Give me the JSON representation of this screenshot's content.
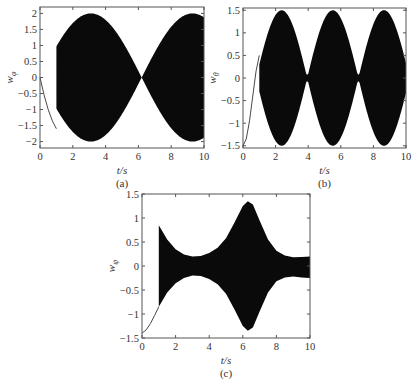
{
  "chart_data": [
    {
      "panel": "(a)",
      "type": "line",
      "title": "",
      "xlabel": "t/s",
      "ylabel": "w_φ",
      "ylabel_main": "w",
      "ylabel_sub": "φ",
      "caption": "(a)",
      "xlim": [
        0,
        10
      ],
      "ylim": [
        -2.2,
        2.2
      ],
      "xticks": [
        0,
        2,
        4,
        6,
        8,
        10
      ],
      "xtick_labels": [
        "0",
        "2",
        "4",
        "6",
        "8",
        "10"
      ],
      "yticks": [
        2,
        1.5,
        1,
        0.5,
        0,
        -0.5,
        -1,
        -1.5,
        -2
      ],
      "ytick_labels": [
        "2",
        "1.5",
        "1",
        "0.5",
        "0",
        "−0.5",
        "−1",
        "−1.5",
        "−2"
      ],
      "grid": false,
      "description": "Initial smooth curve from 0 to about -1.6 over t in [0,1]; then high-frequency oscillation with beating envelope of amplitude |2 sin(pi t / 3.1)|, lobes peaking near t=1.6, 4.7, 7.8 at ±2 and nodes near t=3.1, 6.2, 9.4",
      "initial_curve": {
        "x": [
          0,
          0.25,
          0.5,
          0.75,
          1.0
        ],
        "y": [
          0,
          -0.55,
          -1.0,
          -1.35,
          -1.6
        ]
      },
      "envelope": {
        "start": 1.0,
        "end": 10,
        "amplitude": 2.0,
        "period": 6.2,
        "phase_zero": 0.0
      }
    },
    {
      "panel": "(b)",
      "type": "line",
      "xlabel": "t/s",
      "ylabel": "w_θ",
      "ylabel_main": "w",
      "ylabel_sub": "θ",
      "caption": "(b)",
      "xlim": [
        0,
        10
      ],
      "ylim": [
        -1.55,
        1.55
      ],
      "xticks": [
        0,
        2,
        4,
        6,
        8,
        10
      ],
      "xtick_labels": [
        "0",
        "2",
        "4",
        "6",
        "8",
        "10"
      ],
      "yticks": [
        1.5,
        1,
        0.5,
        0,
        -0.5,
        -1,
        -1.5
      ],
      "ytick_labels": [
        "1.5",
        "1",
        "0.5",
        "0",
        "−0.5",
        "−1",
        "−1.5"
      ],
      "grid": false,
      "description": "Initial curve rising from -1.5 at t=0 to about 0.5 at t=1; then oscillation with envelope lobes peaking at ±1.5 near t=1.6, 3.1, 4.7, 6.3, 7.9, 9.4 and nodes (~±0.1) between",
      "initial_curve": {
        "x": [
          0,
          0.2,
          0.4,
          0.6,
          0.8,
          1.0
        ],
        "y": [
          -1.5,
          -1.35,
          -0.95,
          -0.4,
          0.15,
          0.5
        ]
      },
      "envelope": {
        "start": 1.0,
        "end": 10,
        "amplitude": 1.5,
        "period": 3.14,
        "phase_zero": 0.8,
        "floor": 0.08
      }
    },
    {
      "panel": "(c)",
      "type": "line",
      "xlabel": "t/s",
      "ylabel": "w_ψ",
      "ylabel_main": "w",
      "ylabel_sub": "ψ",
      "caption": "(c)",
      "xlim": [
        0,
        10
      ],
      "ylim": [
        -1.5,
        1.5
      ],
      "xticks": [
        0,
        2,
        4,
        6,
        8,
        10
      ],
      "xtick_labels": [
        "0",
        "2",
        "4",
        "6",
        "8",
        "10"
      ],
      "yticks": [
        1.5,
        1,
        0.5,
        0,
        -0.5,
        -1,
        -1.5
      ],
      "ytick_labels": [
        "1.5",
        "1",
        "0.5",
        "0",
        "−0.5",
        "−1",
        "−1.5"
      ],
      "grid": false,
      "description": "Initial curve rising from -1.4 at t=0 to about -0.85 at t=1; then oscillation band with envelope decreasing from 0.85 at t=1 to 0.2 at t~3, bulging to 1.35 at t~6.3, back to ~0.2 by t~9",
      "initial_curve": {
        "x": [
          0,
          0.25,
          0.5,
          0.75,
          1.0
        ],
        "y": [
          -1.4,
          -1.33,
          -1.2,
          -1.03,
          -0.85
        ]
      },
      "envelope_points": {
        "x": [
          1.0,
          1.5,
          2.0,
          2.5,
          3.0,
          3.5,
          4.0,
          4.5,
          5.0,
          5.5,
          6.0,
          6.3,
          6.6,
          7.0,
          7.5,
          8.0,
          8.5,
          9.0,
          9.5,
          10.0
        ],
        "upper": [
          0.85,
          0.55,
          0.35,
          0.24,
          0.2,
          0.21,
          0.27,
          0.38,
          0.58,
          0.9,
          1.25,
          1.35,
          1.28,
          0.95,
          0.55,
          0.32,
          0.22,
          0.18,
          0.19,
          0.2
        ],
        "lower": [
          -0.85,
          -0.55,
          -0.36,
          -0.25,
          -0.2,
          -0.21,
          -0.27,
          -0.38,
          -0.58,
          -0.9,
          -1.25,
          -1.35,
          -1.28,
          -0.95,
          -0.55,
          -0.32,
          -0.24,
          -0.22,
          -0.24,
          -0.25
        ]
      }
    }
  ],
  "colors": {
    "fill": "#0a0a0a",
    "axis": "#555555",
    "text": "#333333"
  }
}
